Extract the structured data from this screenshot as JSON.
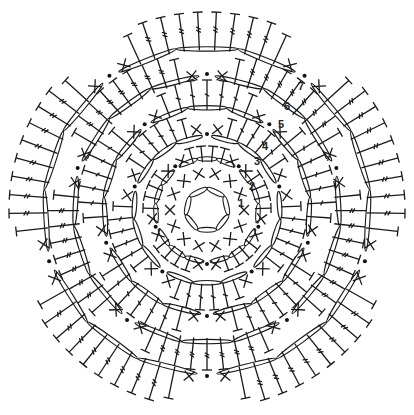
{
  "diagram": {
    "title": "Crochet flower chart",
    "type": "crochet-symbol-chart",
    "center": [
      207,
      210
    ],
    "colors": {
      "ink": "#1a1a1a",
      "background": "#ffffff"
    },
    "symbols": {
      "chain": "oval",
      "single_crochet": "X",
      "half_double_crochet": "T",
      "double_crochet": "T with one bar",
      "treble_crochet": "T with two bars",
      "slip_stitch": "dot"
    },
    "round_labels": [
      {
        "text": "1",
        "x": 238,
        "y": 207
      },
      {
        "text": "2",
        "x": 249,
        "y": 190
      },
      {
        "text": "3",
        "x": 254,
        "y": 165
      },
      {
        "text": "4",
        "x": 262,
        "y": 150
      },
      {
        "text": "5",
        "x": 278,
        "y": 128
      },
      {
        "text": "6",
        "x": 284,
        "y": 110
      },
      {
        "text": "7",
        "x": 298,
        "y": 90
      }
    ],
    "rounds": [
      {
        "id": 1,
        "kind": "ring",
        "radius": 22,
        "chains": 7
      },
      {
        "id": 2,
        "kind": "sc-ring",
        "radius": 42,
        "count": 14
      },
      {
        "id": 3,
        "kind": "petals",
        "petals": 5,
        "radius_in": 48,
        "radius_out": 70,
        "stitches": 6,
        "stitch": "hdc",
        "arc_radius": 58
      },
      {
        "id": 4,
        "kind": "petals",
        "petals": 5,
        "radius_in": 74,
        "radius_out": 100,
        "stitches": 8,
        "stitch": "dc",
        "arc_radius": 80
      },
      {
        "id": 5,
        "kind": "petals",
        "petals": 5,
        "radius_in": 100,
        "radius_out": 130,
        "stitches": 9,
        "stitch": "dc",
        "arc_radius": 110
      },
      {
        "id": 6,
        "kind": "petals",
        "petals": 5,
        "radius_in": 128,
        "radius_out": 160,
        "stitches": 11,
        "stitch": "tr",
        "arc_radius": 140
      },
      {
        "id": 7,
        "kind": "petals",
        "petals": 5,
        "radius_in": 160,
        "radius_out": 198,
        "stitches": 12,
        "stitch": "tr",
        "arc_radius": 170
      }
    ]
  }
}
